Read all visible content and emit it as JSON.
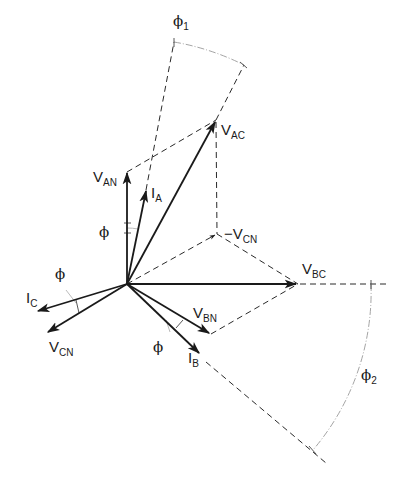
{
  "diagram": {
    "type": "three-phase phasor diagram",
    "origin": {
      "x": 127,
      "y": 284
    },
    "phasors": [
      {
        "id": "V_AN",
        "label": "V",
        "sub": "AN",
        "tip": [
          127,
          172
        ],
        "style": "solid"
      },
      {
        "id": "I_A",
        "label": "I",
        "sub": "A",
        "tip": [
          146,
          190
        ],
        "style": "solid"
      },
      {
        "id": "V_AC",
        "label": "V",
        "sub": "AC",
        "tip": [
          216,
          120
        ],
        "style": "solid"
      },
      {
        "id": "-V_CN",
        "label": "-V",
        "sub": "CN",
        "tip": [
          217,
          234
        ],
        "style": "dashed"
      },
      {
        "id": "V_BC",
        "label": "V",
        "sub": "BC",
        "tip": [
          298,
          284
        ],
        "style": "solid"
      },
      {
        "id": "V_BN",
        "label": "V",
        "sub": "BN",
        "tip": [
          211,
          334
        ],
        "style": "solid"
      },
      {
        "id": "I_B",
        "label": "I",
        "sub": "B",
        "tip": [
          200,
          354
        ],
        "style": "solid"
      },
      {
        "id": "I_C",
        "label": "I",
        "sub": "C",
        "tip": [
          36,
          311
        ],
        "style": "solid"
      },
      {
        "id": "V_CN",
        "label": "V",
        "sub": "CN",
        "tip": [
          46,
          333
        ],
        "style": "solid"
      }
    ],
    "angles": [
      {
        "id": "phi_A",
        "symbol": "ϕ",
        "between": [
          "V_AN",
          "I_A"
        ]
      },
      {
        "id": "phi_C",
        "symbol": "ϕ",
        "between": [
          "V_CN",
          "I_C"
        ]
      },
      {
        "id": "phi_B",
        "symbol": "ϕ",
        "between": [
          "V_BN",
          "I_B"
        ]
      },
      {
        "id": "phi_1",
        "symbol": "ϕ",
        "sub": "1",
        "between": [
          "I_A",
          "V_AC"
        ]
      },
      {
        "id": "phi_2",
        "symbol": "ϕ",
        "sub": "2",
        "between": [
          "V_BC",
          "I_B"
        ]
      }
    ],
    "labels": {
      "v": "V",
      "i": "I",
      "neg_v": "−V",
      "phi": "ϕ",
      "sub_an": "AN",
      "sub_a": "A",
      "sub_ac": "AC",
      "sub_cn": "CN",
      "sub_bc": "BC",
      "sub_bn": "BN",
      "sub_b": "B",
      "sub_c": "C",
      "sub_1": "1",
      "sub_2": "2"
    }
  }
}
